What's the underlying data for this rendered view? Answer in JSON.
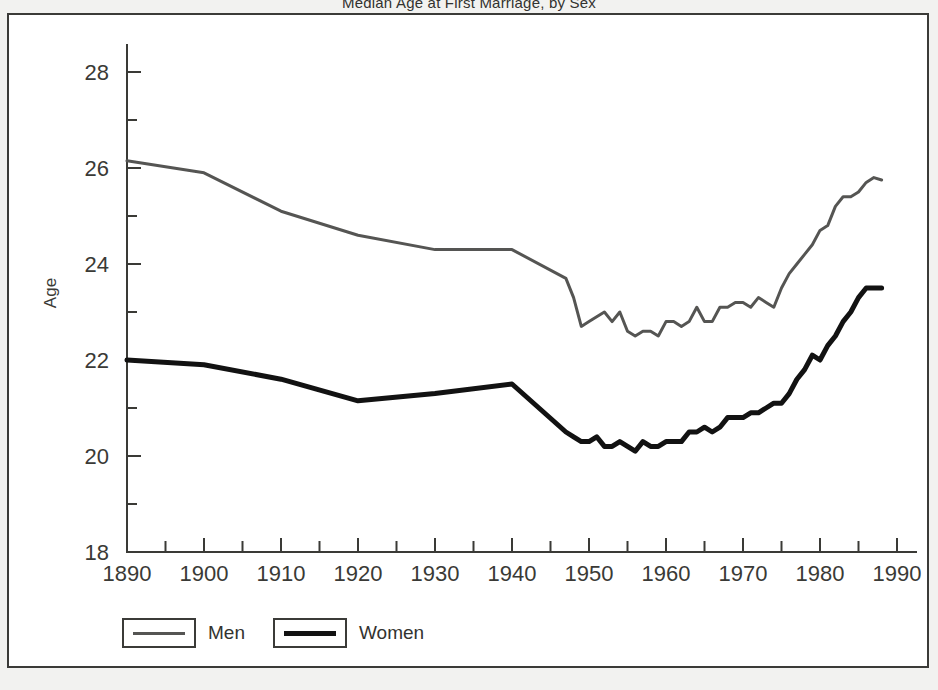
{
  "figure": {
    "title": "Median Age at First Marriage, by Sex",
    "title_clipped": true,
    "frame_color": "#3b3b38",
    "background": "#ffffff"
  },
  "legend": {
    "position": "bottom-left",
    "entries": [
      {
        "label": "Men",
        "color": "#555553",
        "width": 3
      },
      {
        "label": "Women",
        "color": "#121212",
        "width": 5
      }
    ]
  },
  "chart_data": {
    "type": "line",
    "title": "Median Age at First Marriage, by Sex",
    "xlabel": "",
    "ylabel": "Age",
    "xlim": [
      1890,
      1990
    ],
    "ylim": [
      18,
      28.8
    ],
    "grid": false,
    "x_major_ticks": [
      1890,
      1900,
      1910,
      1920,
      1930,
      1940,
      1950,
      1960,
      1970,
      1980,
      1990
    ],
    "x_minor_step": 5,
    "y_major_ticks": [
      18,
      20,
      22,
      24,
      26,
      28
    ],
    "y_minor_step": 1,
    "x_tick_labels": [
      "1890",
      "1900",
      "1910",
      "1920",
      "1930",
      "1940",
      "1950",
      "1960",
      "1970",
      "1980",
      "1990"
    ],
    "y_tick_labels": [
      "18",
      "20",
      "22",
      "24",
      "26",
      "28"
    ],
    "legend_position": "below-axes-left",
    "series": [
      {
        "name": "Men",
        "color": "#555553",
        "width": 3,
        "points": [
          [
            1890,
            26.15
          ],
          [
            1900,
            25.9
          ],
          [
            1910,
            25.1
          ],
          [
            1920,
            24.6
          ],
          [
            1930,
            24.3
          ],
          [
            1940,
            24.3
          ],
          [
            1947,
            23.7
          ],
          [
            1948,
            23.3
          ],
          [
            1949,
            22.7
          ],
          [
            1950,
            22.8
          ],
          [
            1951,
            22.9
          ],
          [
            1952,
            23.0
          ],
          [
            1953,
            22.8
          ],
          [
            1954,
            23.0
          ],
          [
            1955,
            22.6
          ],
          [
            1956,
            22.5
          ],
          [
            1957,
            22.6
          ],
          [
            1958,
            22.6
          ],
          [
            1959,
            22.5
          ],
          [
            1960,
            22.8
          ],
          [
            1961,
            22.8
          ],
          [
            1962,
            22.7
          ],
          [
            1963,
            22.8
          ],
          [
            1964,
            23.1
          ],
          [
            1965,
            22.8
          ],
          [
            1966,
            22.8
          ],
          [
            1967,
            23.1
          ],
          [
            1968,
            23.1
          ],
          [
            1969,
            23.2
          ],
          [
            1970,
            23.2
          ],
          [
            1971,
            23.1
          ],
          [
            1972,
            23.3
          ],
          [
            1973,
            23.2
          ],
          [
            1974,
            23.1
          ],
          [
            1975,
            23.5
          ],
          [
            1976,
            23.8
          ],
          [
            1977,
            24.0
          ],
          [
            1978,
            24.2
          ],
          [
            1979,
            24.4
          ],
          [
            1980,
            24.7
          ],
          [
            1981,
            24.8
          ],
          [
            1982,
            25.2
          ],
          [
            1983,
            25.4
          ],
          [
            1984,
            25.4
          ],
          [
            1985,
            25.5
          ],
          [
            1986,
            25.7
          ],
          [
            1987,
            25.8
          ],
          [
            1988,
            25.75
          ]
        ]
      },
      {
        "name": "Women",
        "color": "#121212",
        "width": 5,
        "points": [
          [
            1890,
            22.0
          ],
          [
            1900,
            21.9
          ],
          [
            1910,
            21.6
          ],
          [
            1920,
            21.15
          ],
          [
            1930,
            21.3
          ],
          [
            1940,
            21.5
          ],
          [
            1947,
            20.5
          ],
          [
            1948,
            20.4
          ],
          [
            1949,
            20.3
          ],
          [
            1950,
            20.3
          ],
          [
            1951,
            20.4
          ],
          [
            1952,
            20.2
          ],
          [
            1953,
            20.2
          ],
          [
            1954,
            20.3
          ],
          [
            1955,
            20.2
          ],
          [
            1956,
            20.1
          ],
          [
            1957,
            20.3
          ],
          [
            1958,
            20.2
          ],
          [
            1959,
            20.2
          ],
          [
            1960,
            20.3
          ],
          [
            1961,
            20.3
          ],
          [
            1962,
            20.3
          ],
          [
            1963,
            20.5
          ],
          [
            1964,
            20.5
          ],
          [
            1965,
            20.6
          ],
          [
            1966,
            20.5
          ],
          [
            1967,
            20.6
          ],
          [
            1968,
            20.8
          ],
          [
            1969,
            20.8
          ],
          [
            1970,
            20.8
          ],
          [
            1971,
            20.9
          ],
          [
            1972,
            20.9
          ],
          [
            1973,
            21.0
          ],
          [
            1974,
            21.1
          ],
          [
            1975,
            21.1
          ],
          [
            1976,
            21.3
          ],
          [
            1977,
            21.6
          ],
          [
            1978,
            21.8
          ],
          [
            1979,
            22.1
          ],
          [
            1980,
            22.0
          ],
          [
            1981,
            22.3
          ],
          [
            1982,
            22.5
          ],
          [
            1983,
            22.8
          ],
          [
            1984,
            23.0
          ],
          [
            1985,
            23.3
          ],
          [
            1986,
            23.5
          ],
          [
            1987,
            23.5
          ],
          [
            1988,
            23.5
          ]
        ]
      }
    ]
  },
  "axis": {
    "title_y": "Age",
    "line_color": "#3a3a36"
  }
}
